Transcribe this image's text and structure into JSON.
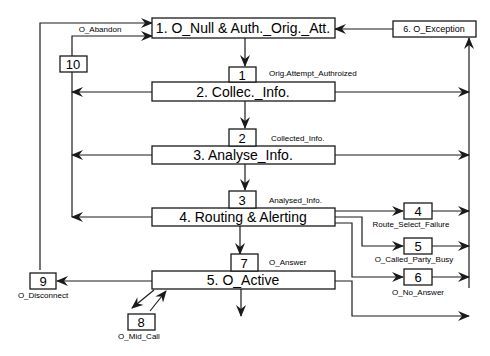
{
  "diagram": {
    "type": "originating-basic-call-state-model",
    "states": [
      {
        "id": 1,
        "label": "1. O_Null & Auth._Orig._Att."
      },
      {
        "id": 2,
        "label": "2. Collec._Info."
      },
      {
        "id": 3,
        "label": "3. Analyse_Info."
      },
      {
        "id": 4,
        "label": "4. Routing & Alerting"
      },
      {
        "id": 5,
        "label": "5. O_Active"
      },
      {
        "id": 6,
        "label": "6. O_Exception"
      }
    ],
    "detection_points": [
      {
        "num": "1",
        "label": "Orig.Attempt_Authroized"
      },
      {
        "num": "2",
        "label": "Collected_Info."
      },
      {
        "num": "3",
        "label": "Analysed_Info."
      },
      {
        "num": "4",
        "label": "Route_Select_Failure"
      },
      {
        "num": "5",
        "label": "O_Called_Party_Busy"
      },
      {
        "num": "6",
        "label": "O_No_Answer"
      },
      {
        "num": "7",
        "label": "O_Answer"
      },
      {
        "num": "8",
        "label": "O_Mid_Call"
      },
      {
        "num": "9",
        "label": "O_Disconnect"
      },
      {
        "num": "10",
        "label": "O_Abandon"
      }
    ]
  }
}
